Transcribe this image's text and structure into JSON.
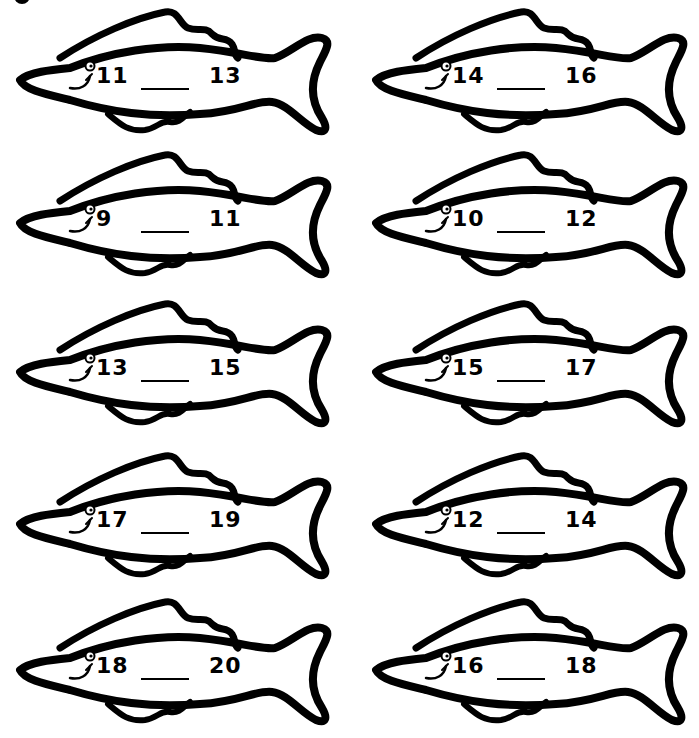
{
  "worksheet": {
    "instruction": "Write the missing number between each pair",
    "fish": [
      {
        "left": "11",
        "blank": "",
        "right": "13"
      },
      {
        "left": "14",
        "blank": "",
        "right": "16"
      },
      {
        "left": "9",
        "blank": "",
        "right": "11"
      },
      {
        "left": "10",
        "blank": "",
        "right": "12"
      },
      {
        "left": "13",
        "blank": "",
        "right": "15"
      },
      {
        "left": "15",
        "blank": "",
        "right": "17"
      },
      {
        "left": "17",
        "blank": "",
        "right": "19"
      },
      {
        "left": "12",
        "blank": "",
        "right": "14"
      },
      {
        "left": "18",
        "blank": "",
        "right": "20"
      },
      {
        "left": "16",
        "blank": "",
        "right": "18"
      }
    ]
  },
  "colors": {
    "ink": "#000000",
    "paper": "#ffffff"
  }
}
